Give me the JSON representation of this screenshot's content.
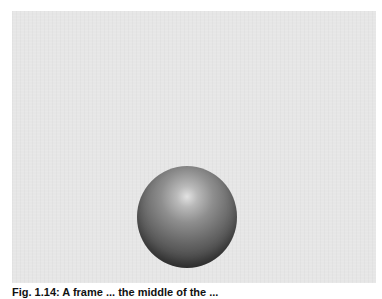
{
  "figure": {
    "panel_color": "#e6e6e6",
    "object": "sphere",
    "caption": "Fig. 1.14: A frame ... the middle of the ..."
  }
}
